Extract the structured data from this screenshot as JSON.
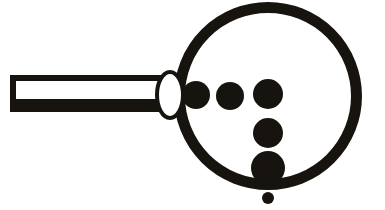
{
  "image": {
    "title": "Magnifying Glass Pictogram",
    "width": 385,
    "height": 210,
    "background_color": "#ffffff",
    "ink_color": "#17140f",
    "style": "high-contrast black-and-white clip-art silhouette",
    "subject": "magnifying glass viewed from the side with round lens and straight handle, six solid dots arranged inside and below the lens"
  },
  "parts": {
    "lens_ring": {
      "name": "lens-ring",
      "shape": "circle-outline",
      "center_x": 268,
      "center_y": 96,
      "outer_radius": 94,
      "stroke_width": 11,
      "color": "#17140f"
    },
    "handle": {
      "name": "handle",
      "shape": "hollow-rectangle",
      "left_x": 10,
      "right_x": 172,
      "top_y": 75,
      "bottom_y": 112,
      "top_stroke": 6,
      "bottom_stroke": 13,
      "end_stroke": 6,
      "fill": "#ffffff",
      "color": "#17140f"
    },
    "collar": {
      "name": "handle-collar",
      "shape": "ellipse-outline",
      "center_x": 170,
      "center_y": 95,
      "radius_x": 13,
      "radius_y": 23,
      "stroke_width": 4,
      "fill": "#ffffff",
      "color": "#17140f"
    }
  },
  "dots": [
    {
      "name": "dot-left",
      "cx": 196,
      "cy": 95,
      "r": 14,
      "note": "overlaps left lens rim"
    },
    {
      "name": "dot-middle",
      "cx": 230,
      "cy": 96,
      "r": 14,
      "note": "free-standing inside lens"
    },
    {
      "name": "dot-column-top",
      "cx": 268,
      "cy": 94,
      "r": 15,
      "note": "top of vertical column"
    },
    {
      "name": "dot-column-middle",
      "cx": 268,
      "cy": 133,
      "r": 15,
      "note": "middle of vertical column"
    },
    {
      "name": "dot-column-bottom",
      "cx": 268,
      "cy": 168,
      "r": 17,
      "note": "touches bottom lens rim"
    },
    {
      "name": "dot-detached",
      "cx": 268,
      "cy": 198,
      "r": 6,
      "note": "small dot outside lens, below rim"
    }
  ]
}
